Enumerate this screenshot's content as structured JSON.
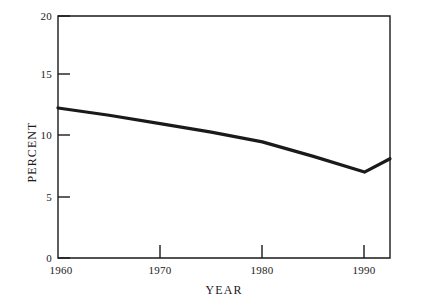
{
  "chart_data": {
    "type": "line",
    "title": "",
    "xlabel": "YEAR",
    "ylabel": "PERCENT",
    "xlim": [
      1960,
      1992.5
    ],
    "ylim": [
      0,
      20
    ],
    "xticks": [
      1960,
      1970,
      1980,
      1990
    ],
    "xtick_labels": [
      "1960",
      "1970",
      "1980",
      "1990"
    ],
    "yticks": [
      0,
      5,
      10,
      15,
      20
    ],
    "ytick_labels": [
      "0",
      "5",
      "10",
      "15",
      "20"
    ],
    "grid": false,
    "legend": null,
    "series": [
      {
        "name": "Percent",
        "color": "#1a1a1a",
        "line_width": 3.2,
        "x": [
          1960,
          1965,
          1970,
          1975,
          1980,
          1985,
          1990,
          1992.5
        ],
        "values": [
          12.4,
          11.8,
          11.1,
          10.4,
          9.6,
          8.4,
          7.1,
          8.2
        ]
      }
    ]
  },
  "axes": {
    "y_title": "PERCENT",
    "x_title": "YEAR",
    "frame_color": "#1a1a1a"
  }
}
